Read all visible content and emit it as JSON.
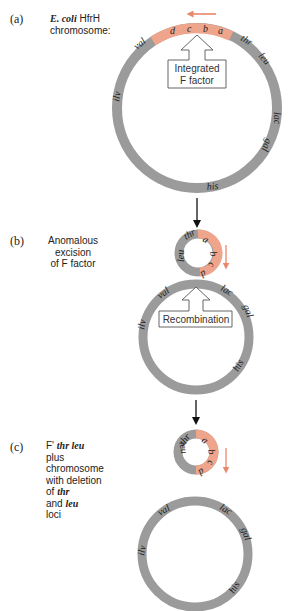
{
  "panels": [
    {
      "id": "a",
      "tag": "(a)",
      "caption_lines": [
        {
          "parts": [
            {
              "text": "E. coli",
              "italic": true
            },
            {
              "text": " HfrH",
              "italic": false
            }
          ]
        },
        {
          "parts": [
            {
              "text": "chromosome:",
              "italic": false
            }
          ]
        }
      ],
      "chromosome_genes": [
        "val",
        "thr",
        "leu",
        "lac",
        "gal",
        "his",
        "ilv"
      ],
      "f_factor_genes": [
        "d",
        "c",
        "b",
        "a"
      ],
      "box_label_lines": [
        "Integrated",
        "F factor"
      ]
    },
    {
      "id": "b",
      "tag": "(b)",
      "caption_lines": [
        {
          "parts": [
            {
              "text": "Anomalous",
              "italic": false
            }
          ]
        },
        {
          "parts": [
            {
              "text": "excision",
              "italic": false
            }
          ]
        },
        {
          "parts": [
            {
              "text": "of F factor",
              "italic": false
            }
          ]
        }
      ],
      "loop_genes": [
        "leu",
        "thr",
        "a",
        "b",
        "c",
        "d"
      ],
      "chromosome_genes": [
        "val",
        "lac",
        "gal",
        "ilv",
        "his"
      ],
      "box_label_lines": [
        "Recombination"
      ]
    },
    {
      "id": "c",
      "tag": "(c)",
      "caption_lines": [
        {
          "parts": [
            {
              "text": "F' ",
              "italic": false
            },
            {
              "text": "thr leu",
              "italic": true
            }
          ]
        },
        {
          "parts": [
            {
              "text": "plus",
              "italic": false
            }
          ]
        },
        {
          "parts": [
            {
              "text": "chromosome",
              "italic": false
            }
          ]
        },
        {
          "parts": [
            {
              "text": "with deletion",
              "italic": false
            }
          ]
        },
        {
          "parts": [
            {
              "text": "of ",
              "italic": false
            },
            {
              "text": "thr",
              "italic": true
            }
          ]
        },
        {
          "parts": [
            {
              "text": "and ",
              "italic": false
            },
            {
              "text": "leu",
              "italic": true
            }
          ]
        },
        {
          "parts": [
            {
              "text": "loci",
              "italic": false
            }
          ]
        }
      ],
      "plasmid_genes": [
        "thr",
        "leu",
        "a",
        "b",
        "c",
        "d"
      ],
      "chromosome_genes": [
        "val",
        "lac",
        "gal",
        "ilv",
        "his"
      ]
    }
  ],
  "colors": {
    "chromosome": "#9b9b9b",
    "f_factor": "#eea58c",
    "arrow_f": "#e8876a",
    "arrow_step": "#111111",
    "box_border": "#555555"
  },
  "labels": {
    "a_tag": "(a)",
    "a_l1_i": "E. coli",
    "a_l1": " HfrH",
    "a_l2": "chromosome:",
    "b_tag": "(b)",
    "b_l1": "Anomalous",
    "b_l2": "excision",
    "b_l3": "of F factor",
    "c_tag": "(c)",
    "c_l1": "F' ",
    "c_l1_i": "thr leu",
    "c_l2": "plus",
    "c_l3": "chromosome",
    "c_l4": "with deletion",
    "c_l5": "of ",
    "c_l5_i": "thr",
    "c_l6": "and ",
    "c_l6_i": "leu",
    "c_l7": "loci",
    "box_a_1": "Integrated",
    "box_a_2": "F factor",
    "box_b": "Recombination",
    "g_val": "val",
    "g_thr": "thr",
    "g_leu": "leu",
    "g_lac": "lac",
    "g_gal": "gal",
    "g_his": "his",
    "g_ilv": "ilv",
    "f_a": "a",
    "f_b": "b",
    "f_c": "c",
    "f_d": "d"
  }
}
